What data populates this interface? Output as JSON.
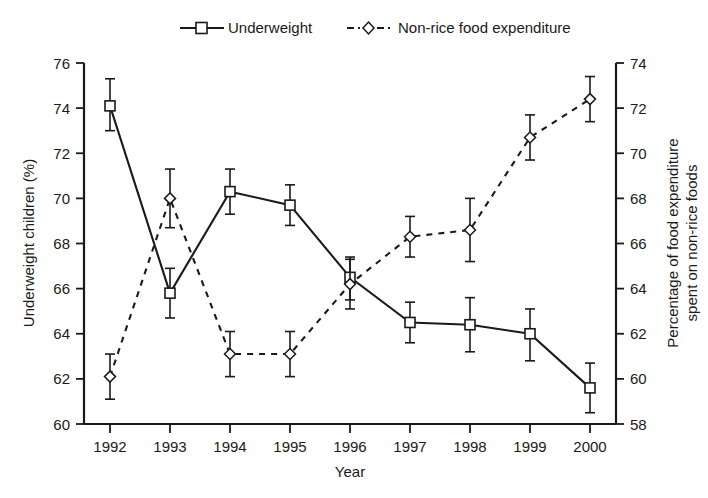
{
  "chart_data": {
    "type": "line",
    "title": "",
    "xlabel": "Year",
    "ylabel": "Underweight children (%)",
    "y2label_line1": "Percentage of food expenditure",
    "y2label_line2": "spent on non-rice foods",
    "categories": [
      "1992",
      "1993",
      "1994",
      "1995",
      "1996",
      "1997",
      "1998",
      "1999",
      "2000"
    ],
    "x": [
      1992,
      1993,
      1994,
      1995,
      1996,
      1997,
      1998,
      1999,
      2000
    ],
    "ylim": [
      60,
      76
    ],
    "yticks": [
      60,
      62,
      64,
      66,
      68,
      70,
      72,
      74,
      76
    ],
    "y2lim": [
      58,
      74
    ],
    "y2ticks": [
      58,
      60,
      62,
      64,
      66,
      68,
      70,
      72,
      74
    ],
    "grid": false,
    "legend_position": "top-center",
    "series": [
      {
        "name": "Underweight",
        "axis": "left",
        "marker": "open-square",
        "linestyle": "solid",
        "values": [
          74.1,
          65.8,
          70.3,
          69.7,
          66.5,
          64.5,
          64.4,
          64.0,
          61.6
        ],
        "err_low": [
          73.0,
          64.7,
          69.3,
          68.8,
          65.5,
          63.6,
          63.2,
          62.8,
          60.5
        ],
        "err_high": [
          75.3,
          66.9,
          71.3,
          70.6,
          67.4,
          65.4,
          65.6,
          65.1,
          62.7
        ]
      },
      {
        "name": "Non-rice food expenditure",
        "axis": "right",
        "marker": "open-diamond",
        "linestyle": "dashed",
        "values": [
          60.1,
          68.0,
          61.1,
          61.1,
          64.2,
          66.3,
          66.6,
          70.7,
          72.4
        ],
        "err_low": [
          59.1,
          66.7,
          60.1,
          60.1,
          63.1,
          65.4,
          65.2,
          69.7,
          71.4
        ],
        "err_high": [
          61.1,
          69.3,
          62.1,
          62.1,
          65.3,
          67.2,
          68.0,
          71.7,
          73.4
        ]
      }
    ]
  },
  "legend": {
    "items": [
      {
        "label": "Underweight",
        "marker": "open-square",
        "linestyle": "solid"
      },
      {
        "label": "Non-rice food expenditure",
        "marker": "open-diamond",
        "linestyle": "dashed"
      }
    ]
  },
  "axes": {
    "x_title": "Year",
    "y_left_title": "Underweight children (%)",
    "y_right_title_line1": "Percentage of food expenditure",
    "y_right_title_line2": "spent on non-rice foods"
  }
}
